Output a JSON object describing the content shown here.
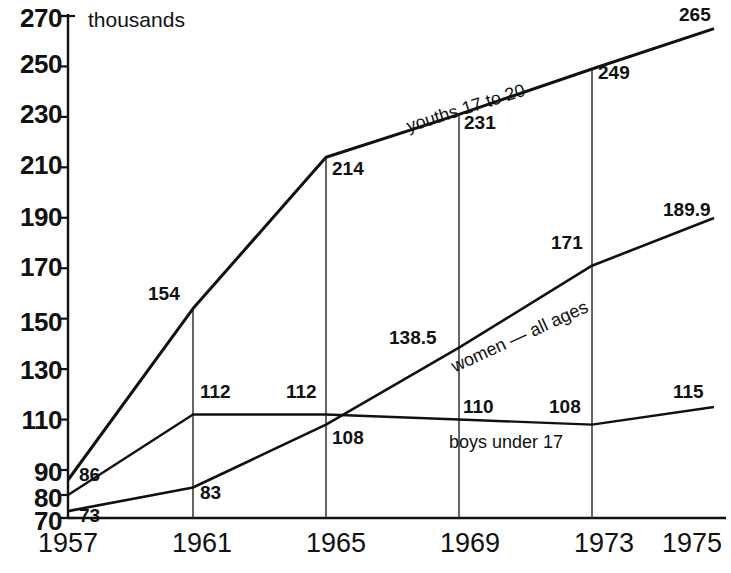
{
  "chart_data": {
    "type": "line",
    "title": "",
    "subtitle": "",
    "unit_label": "thousands",
    "xlabel": "",
    "ylabel": "thousands",
    "grid": "vertical-dropline",
    "legend_position": "inline-along-lines",
    "categories": [
      "1957",
      "1961",
      "1965",
      "1969",
      "1973",
      "1975"
    ],
    "x": [
      1957,
      1961,
      1965,
      1969,
      1973,
      1975
    ],
    "xtick_labels": [
      "1957",
      "1961",
      "1965",
      "1969",
      "1973",
      "1975"
    ],
    "ytick_labels": [
      "70",
      "80",
      "90",
      "110",
      "130",
      "150",
      "170",
      "190",
      "210",
      "230",
      "250",
      "270"
    ],
    "ytick_values": [
      70,
      80,
      90,
      110,
      130,
      150,
      170,
      190,
      210,
      230,
      250,
      270
    ],
    "ylim": [
      70,
      270
    ],
    "xlim": [
      1957,
      1975
    ],
    "series": [
      {
        "name": "youths 17 to 20",
        "label_text": "youths 17 to 20",
        "values": [
          86,
          154,
          214,
          231,
          249,
          265
        ],
        "point_labels": [
          "86",
          "154",
          "214",
          "231",
          "249",
          "265"
        ]
      },
      {
        "name": "women — all ages",
        "label_text": "women — all ages",
        "values": [
          73,
          83,
          108,
          138.5,
          171,
          189.9
        ],
        "point_labels": [
          "73",
          "83",
          "108",
          "138.5",
          "171",
          "189.9"
        ]
      },
      {
        "name": "boys under 17",
        "label_text": "boys under 17",
        "values": [
          80,
          112,
          112,
          110,
          108,
          115
        ],
        "point_labels": [
          "",
          "112",
          "112",
          "110",
          "108",
          "115"
        ]
      }
    ],
    "colors": {
      "line": "#111111",
      "axis": "#111111",
      "gridline": "#333333",
      "background": "#ffffff"
    }
  }
}
